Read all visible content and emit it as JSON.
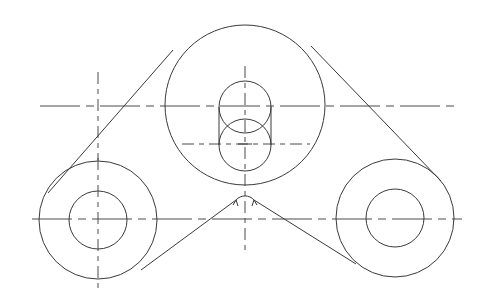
{
  "drawing": {
    "type": "belt-drive-technical-drawing",
    "line_color": "#3a3a3a",
    "background": "#ffffff",
    "pulleys": [
      {
        "name": "top-pulley",
        "cx": 245,
        "cy": 105,
        "outer_r": 80
      },
      {
        "name": "left-pulley",
        "cx": 98,
        "cy": 220,
        "outer_r": 59,
        "inner_r": 29
      },
      {
        "name": "right-pulley",
        "cx": 395,
        "cy": 218,
        "outer_r": 59,
        "inner_r": 29
      }
    ],
    "slot": {
      "upper_cy": 107,
      "lower_cy": 145,
      "cx": 245,
      "r": 26
    },
    "idler_arc": {
      "cx": 245,
      "cy": 205,
      "r": 12
    }
  }
}
